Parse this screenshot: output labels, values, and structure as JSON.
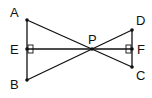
{
  "diagram": {
    "type": "geometry",
    "points": [
      {
        "id": "A",
        "label": "A",
        "x": 27,
        "y": 20
      },
      {
        "id": "E",
        "label": "E",
        "x": 27,
        "y": 49
      },
      {
        "id": "B",
        "label": "B",
        "x": 27,
        "y": 80
      },
      {
        "id": "P",
        "label": "P",
        "x": 92,
        "y": 49
      },
      {
        "id": "D",
        "label": "D",
        "x": 132,
        "y": 30
      },
      {
        "id": "F",
        "label": "F",
        "x": 132,
        "y": 49
      },
      {
        "id": "C",
        "label": "C",
        "x": 132,
        "y": 67
      }
    ],
    "segments": [
      "AB",
      "DC",
      "EF",
      "AC",
      "BD"
    ],
    "right_angles": [
      "E",
      "F"
    ],
    "labels": {
      "A": "A",
      "B": "B",
      "C": "C",
      "D": "D",
      "E": "E",
      "F": "F",
      "P": "P"
    }
  }
}
